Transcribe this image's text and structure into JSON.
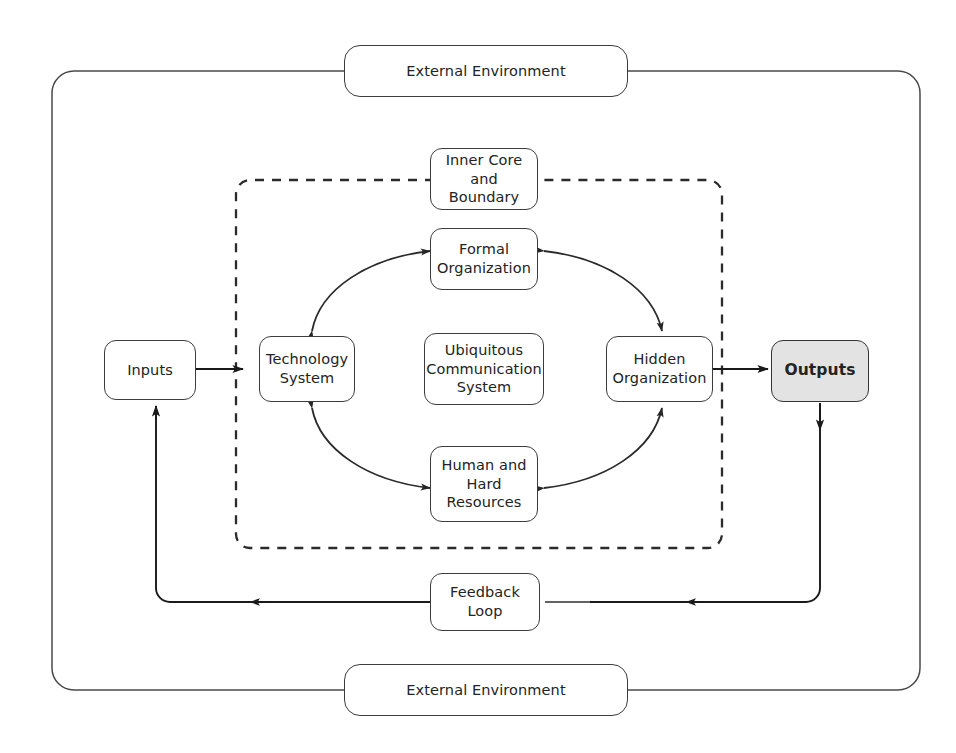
{
  "diagram": {
    "colors": {
      "stroke": "#3c3c3c",
      "text": "#232323",
      "outputs_fill": "#e3e3e3",
      "background": "#ffffff"
    },
    "nodes": {
      "external_environment_top": "External Environment",
      "external_environment_bottom": "External Environment",
      "inner_core_and_boundary": "Inner Core and\nBoundary",
      "formal_organization": "Formal\nOrganization",
      "technology_system": "Technology\nSystem",
      "ubiquitous_communication_system": "Ubiquitous\nCommunication\nSystem",
      "hidden_organization": "Hidden\nOrganization",
      "human_and_hard_resources": "Human and\nHard\nResources",
      "inputs": "Inputs",
      "outputs": "Outputs",
      "feedback_loop": "Feedback Loop"
    },
    "node_lines": {
      "inner_core_and_boundary": [
        "Inner Core and",
        "Boundary"
      ],
      "formal_organization": [
        "Formal",
        "Organization"
      ],
      "technology_system": [
        "Technology",
        "System"
      ],
      "ubiquitous_communication_system": [
        "Ubiquitous",
        "Communication",
        "System"
      ],
      "hidden_organization": [
        "Hidden",
        "Organization"
      ],
      "human_and_hard_resources": [
        "Human and",
        "Hard",
        "Resources"
      ],
      "inputs": [
        "Inputs"
      ],
      "outputs": [
        "Outputs"
      ],
      "feedback_loop": [
        "Feedback Loop"
      ],
      "external_environment_top": [
        "External Environment"
      ],
      "external_environment_bottom": [
        "External Environment"
      ]
    },
    "connections": [
      {
        "from": "inputs",
        "to": "technology_system",
        "style": "solid",
        "arrows": "one-way"
      },
      {
        "from": "hidden_organization",
        "to": "outputs",
        "style": "solid",
        "arrows": "one-way"
      },
      {
        "from": "technology_system",
        "to": "formal_organization",
        "style": "curve",
        "arrows": "two-way"
      },
      {
        "from": "formal_organization",
        "to": "hidden_organization",
        "style": "curve",
        "arrows": "two-way"
      },
      {
        "from": "technology_system",
        "to": "human_and_hard_resources",
        "style": "curve",
        "arrows": "two-way"
      },
      {
        "from": "human_and_hard_resources",
        "to": "hidden_organization",
        "style": "curve",
        "arrows": "two-way"
      },
      {
        "from": "outputs",
        "to": "feedback_loop",
        "style": "solid",
        "arrows": "one-way"
      },
      {
        "from": "feedback_loop",
        "to": "inputs",
        "style": "solid",
        "arrows": "one-way"
      }
    ],
    "boundaries": [
      {
        "name": "external-environment-frame",
        "style": "solid"
      },
      {
        "name": "inner-core-boundary-frame",
        "style": "dashed"
      }
    ]
  }
}
